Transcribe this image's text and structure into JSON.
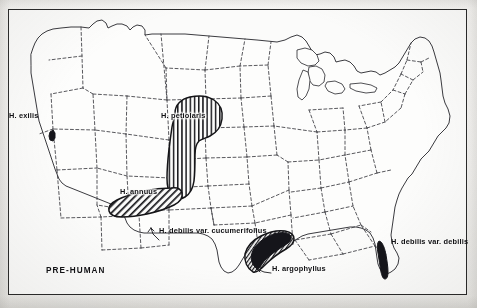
{
  "figure": {
    "caption": "PRE-HUMAN",
    "frame": {
      "border_color": "#2a2a2a",
      "paper_color": "#fbfbfa"
    },
    "ink_color": "#15151a"
  },
  "map": {
    "region_name": "united-states",
    "boundary_style": "dashed",
    "boundary_color": "#3a3a40",
    "coastline_color": "#25252a"
  },
  "labels": {
    "exilis": "H. exilis",
    "petiolaris": "H. petiolaris",
    "annuus": "H. annuus",
    "cucumerifolius": "H. debilis var. cucumerifolius",
    "argophyllus": "H. argophyllus",
    "debilis": "H. debilis var. debilis"
  },
  "ranges": [
    {
      "name": "exilis",
      "label": "H. exilis",
      "fill": "solid-black",
      "location": "california-coast-range"
    },
    {
      "name": "petiolaris",
      "label": "H. petiolaris",
      "fill": "vertical-hatch",
      "location": "great-plains"
    },
    {
      "name": "annuus",
      "label": "H. annuus",
      "fill": "diagonal-hatch",
      "location": "southwest"
    },
    {
      "name": "cucumerifolius",
      "label": "H. debilis var. cucumerifolius",
      "fill": "fine-hatch-band",
      "location": "texas-gulf-coast"
    },
    {
      "name": "argophyllus",
      "label": "H. argophyllus",
      "fill": "solid-black-band",
      "location": "texas-coast"
    },
    {
      "name": "debilis",
      "label": "H. debilis var. debilis",
      "fill": "solid-black-band",
      "location": "florida-east-coast"
    }
  ]
}
